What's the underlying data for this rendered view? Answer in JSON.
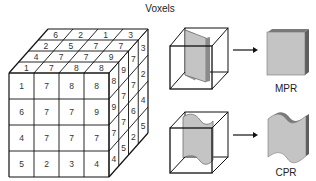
{
  "title": "Voxels",
  "voxel_cube": {
    "front_face": [
      [
        "1",
        "7",
        "8",
        "8"
      ],
      [
        "6",
        "7",
        "7",
        "9"
      ],
      [
        "4",
        "7",
        "7",
        "7"
      ],
      [
        "5",
        "2",
        "3",
        "4"
      ]
    ],
    "top_face_back_to_front": [
      [
        "6",
        "2",
        "1",
        "3"
      ],
      [
        "2",
        "5",
        "7",
        "7"
      ],
      [
        "4",
        "7",
        "7",
        "9"
      ],
      [
        "1",
        "7",
        "8",
        "8"
      ]
    ],
    "right_face_front_to_back": [
      [
        "8",
        "9",
        "7",
        "3"
      ],
      [
        "9",
        "7",
        "7",
        "2"
      ],
      [
        "7",
        "7",
        "6",
        "4"
      ],
      [
        "4",
        "5",
        "2",
        "5"
      ]
    ]
  },
  "reconstructions": [
    {
      "label": "MPR",
      "description": "planar slice"
    },
    {
      "label": "CPR",
      "description": "curved slice"
    }
  ],
  "colors": {
    "slice_fill": "#c4c4c4",
    "slice_edge": "#6e6e6e",
    "line": "#111111"
  }
}
